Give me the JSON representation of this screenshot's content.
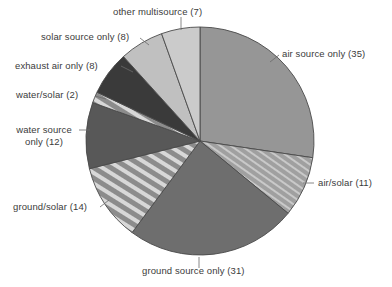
{
  "chart_data": {
    "type": "pie",
    "title": "",
    "subtitle": "",
    "xlabel": "",
    "ylabel": "",
    "total": 128,
    "legend_position": "callout-labels",
    "grid": false,
    "categories": [
      "air source only",
      "air/solar",
      "ground source only",
      "ground/solar",
      "water source only",
      "water/solar",
      "exhaust air only",
      "solar source only",
      "other multisource"
    ],
    "values": [
      35,
      11,
      31,
      14,
      12,
      2,
      8,
      8,
      7
    ],
    "slices": [
      {
        "name": "air source only",
        "value": 35,
        "label": "air source only (35)",
        "fill": "#969696",
        "pattern": "solid",
        "start_angle": 0,
        "end_angle": 98.4
      },
      {
        "name": "air/solar",
        "value": 11,
        "label": "air/solar (11)",
        "fill": "#a8a8a8",
        "pattern": "fine-diagonal-hatch",
        "start_angle": 98.4,
        "end_angle": 129.4
      },
      {
        "name": "ground source only",
        "value": 31,
        "label": "ground source only (31)",
        "fill": "#6e6e6e",
        "pattern": "solid",
        "start_angle": 129.4,
        "end_angle": 216.6
      },
      {
        "name": "ground/solar",
        "value": 14,
        "label": "ground/solar (14)",
        "fill": "#8a8a8a",
        "pattern": "bold-diagonal-stripes",
        "start_angle": 216.6,
        "end_angle": 255.9
      },
      {
        "name": "water source only",
        "value": 12,
        "label": "water source only (12)",
        "fill": "#585858",
        "pattern": "solid",
        "start_angle": 255.9,
        "end_angle": 289.7
      },
      {
        "name": "water/solar",
        "value": 2,
        "label": "water/solar (2)",
        "fill": "#9a9a9a",
        "pattern": "bold-diagonal-stripes",
        "start_angle": 289.7,
        "end_angle": 295.3
      },
      {
        "name": "exhaust air only",
        "value": 8,
        "label": "exhaust air only (8)",
        "fill": "#3a3a3a",
        "pattern": "solid",
        "start_angle": 295.3,
        "end_angle": 317.8
      },
      {
        "name": "solar source only",
        "value": 8,
        "label": "solar source only (8)",
        "fill": "#c0c0c0",
        "pattern": "solid",
        "start_angle": 317.8,
        "end_angle": 340.3
      },
      {
        "name": "other multisource",
        "value": 7,
        "label": "other multisource (7)",
        "fill": "#cbcbcb",
        "pattern": "solid",
        "start_angle": 340.3,
        "end_angle": 360
      }
    ],
    "colors": {
      "air_source_only": "#969696",
      "air_solar": "#a8a8a8",
      "ground_source_only": "#6e6e6e",
      "ground_solar": "#8a8a8a",
      "water_source_only": "#585858",
      "water_solar": "#9a9a9a",
      "exhaust_air_only": "#3a3a3a",
      "solar_source_only": "#c0c0c0",
      "other_multisource": "#cbcbcb",
      "outline": "#4a4a4a",
      "label_text": "#3b3b3b",
      "leader_line": "#6b6b6b",
      "background": "#ffffff"
    }
  },
  "labels": {
    "other_multisource": "other multisource (7)",
    "solar_source_only": "solar source only (8)",
    "exhaust_air_only": "exhaust air only (8)",
    "water_solar": "water/solar (2)",
    "water_source_only_line1": "water source",
    "water_source_only_line2": "only (12)",
    "ground_solar": "ground/solar (14)",
    "ground_source_only": "ground source only (31)",
    "air_solar": "air/solar (11)",
    "air_source_only": "air source only (35)"
  }
}
